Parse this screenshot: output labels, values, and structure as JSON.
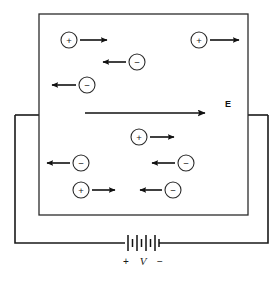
{
  "figure": {
    "colors": {
      "ink": "#1a1a1a",
      "box_stroke": "#2b2b2b",
      "background": "#ffffff"
    },
    "conductor_box": {
      "x": 39,
      "y": 14,
      "width": 209,
      "height": 201
    },
    "circuit": {
      "left_wire_x": 15,
      "right_wire_x": 268,
      "top_y": 115,
      "bottom_y": 243,
      "battery_center_x": 142,
      "battery_y": 243
    },
    "field": {
      "label": "E",
      "label_x": 228,
      "label_y": 104,
      "arrow_x1": 85,
      "arrow_x2": 207,
      "arrow_y": 113,
      "direction": "right"
    },
    "battery": {
      "plate_count": 8,
      "terminals": {
        "positive_sign": "+",
        "positive_x": 126,
        "negative_sign": "−",
        "negative_x": 160,
        "sign_y": 261
      },
      "voltage_label": "V",
      "voltage_label_x": 143,
      "voltage_label_y": 261
    },
    "charges": [
      {
        "sign": "+",
        "cx": 69,
        "cy": 40,
        "r": 8,
        "arrow_from": 80,
        "arrow_to": 111,
        "direction": "right"
      },
      {
        "sign": "+",
        "cx": 199,
        "cy": 40,
        "r": 8,
        "arrow_from": 210,
        "arrow_to": 243,
        "direction": "right"
      },
      {
        "sign": "−",
        "cx": 137,
        "cy": 62,
        "r": 8,
        "arrow_from": 126,
        "arrow_to": 99,
        "direction": "left"
      },
      {
        "sign": "−",
        "cx": 87,
        "cy": 85,
        "r": 8,
        "arrow_from": 76,
        "arrow_to": 48,
        "direction": "left"
      },
      {
        "sign": "+",
        "cx": 139,
        "cy": 137,
        "r": 8,
        "arrow_from": 150,
        "arrow_to": 178,
        "direction": "right"
      },
      {
        "sign": "−",
        "cx": 81,
        "cy": 163,
        "r": 8,
        "arrow_from": 70,
        "arrow_to": 43,
        "direction": "left"
      },
      {
        "sign": "−",
        "cx": 186,
        "cy": 163,
        "r": 8,
        "arrow_from": 175,
        "arrow_to": 148,
        "direction": "left"
      },
      {
        "sign": "+",
        "cx": 81,
        "cy": 190,
        "r": 8,
        "arrow_from": 92,
        "arrow_to": 119,
        "direction": "right"
      },
      {
        "sign": "−",
        "cx": 173,
        "cy": 190,
        "r": 8,
        "arrow_from": 162,
        "arrow_to": 136,
        "direction": "left"
      }
    ]
  }
}
